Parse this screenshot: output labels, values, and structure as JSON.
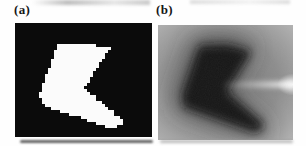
{
  "figure": {
    "panel_a": {
      "label": "(a)",
      "kind": "binary shape image",
      "background_color": "#0b0b0b",
      "shape_color": "#fbfbfb",
      "pixel_cell": 3
    },
    "panel_b": {
      "label": "(b)",
      "kind": "grayscale distance map of same shape",
      "corner_color": "#b6b6b6",
      "mid_color": "#8d8d8d",
      "inner_color": "#757575",
      "halo_color": "#3c3c3c",
      "shape_core_color": "#161616",
      "streak_color": "#ffffff",
      "streak_y": 59,
      "streak_x_start": 64,
      "streak_x_end": 137
    },
    "canvas": {
      "width": 137,
      "height": 114
    },
    "shape_polygon": [
      [
        42,
        21
      ],
      [
        70,
        20
      ],
      [
        95,
        26
      ],
      [
        69,
        66
      ],
      [
        102,
        94
      ],
      [
        107,
        98
      ],
      [
        106,
        103
      ],
      [
        98,
        106
      ],
      [
        26,
        81
      ],
      [
        25,
        69
      ]
    ]
  }
}
